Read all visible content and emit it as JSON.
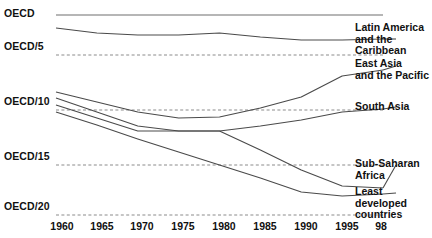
{
  "chart_data": {
    "type": "line",
    "title": "",
    "subtitle": "",
    "xlabel": "",
    "ylabel": "",
    "grid": true,
    "legend_position": "right-inline",
    "x": [
      1960,
      1965,
      1970,
      1975,
      1980,
      1985,
      1990,
      1995,
      1998
    ],
    "xtick_labels": [
      "1960",
      "1965",
      "1970",
      "1975",
      "1980",
      "1985",
      "1990",
      "1995",
      "98"
    ],
    "ytick_labels": [
      "OECD",
      "OECD/5",
      "OECD/10",
      "OECD/15",
      "OECD/20"
    ],
    "ytick_values": [
      1,
      0.2,
      0.1,
      0.06667,
      0.05
    ],
    "yaxis_note": "Income relative to OECD average, descending scale",
    "series": [
      {
        "name": "OECD",
        "label": "OECD",
        "label_side": "left",
        "values": [
          1.0,
          1.0,
          1.0,
          1.0,
          1.0,
          1.0,
          1.0,
          1.0,
          1.0
        ],
        "y_px": [
          15,
          15,
          15,
          15,
          15,
          15,
          15,
          15,
          15
        ]
      },
      {
        "name": "Latin America and the Caribbean",
        "label": "Latin America\nand the Caribbean",
        "label_side": "right",
        "values": [
          0.32,
          0.3,
          0.29,
          0.29,
          0.3,
          0.28,
          0.26,
          0.26,
          0.26
        ],
        "y_px": [
          28,
          33,
          35,
          35,
          33,
          37,
          40,
          40,
          39
        ]
      },
      {
        "name": "East Asia and the Pacific",
        "label": "East Asia\nand the Pacific",
        "label_side": "right",
        "values": [
          0.12,
          0.115,
          0.115,
          0.12,
          0.13,
          0.14,
          0.155,
          0.185,
          0.19
        ],
        "y_px": [
          92,
          102,
          112,
          118,
          117,
          108,
          97,
          76,
          70
        ]
      },
      {
        "name": "South Asia",
        "label": "South Asia",
        "label_side": "right",
        "values": [
          0.112,
          0.106,
          0.1,
          0.098,
          0.098,
          0.1,
          0.104,
          0.11,
          0.113
        ],
        "y_px": [
          98,
          112,
          126,
          131,
          131,
          126,
          120,
          112,
          109
        ]
      },
      {
        "name": "Sub-Saharan Africa",
        "label": "Sub-Saharan\nAfrica",
        "label_side": "right",
        "values": [
          0.105,
          0.102,
          0.099,
          0.097,
          0.097,
          0.086,
          0.072,
          0.062,
          0.06
        ],
        "y_px": [
          105,
          118,
          131,
          131,
          131,
          150,
          170,
          186,
          188
        ]
      },
      {
        "name": "Least developed countries",
        "label": "Least developed\ncountries",
        "label_side": "right",
        "values": [
          0.1,
          0.092,
          0.084,
          0.076,
          0.068,
          0.061,
          0.056,
          0.054,
          0.055
        ],
        "y_px": [
          112,
          125,
          139,
          152,
          165,
          178,
          192,
          196,
          194
        ]
      }
    ],
    "gridlines_y_px": [
      55,
      110,
      165,
      215
    ],
    "xaxis_px": {
      "x0": 56,
      "x1": 383
    },
    "colors": {
      "line": "#4a4a4a",
      "oecd_line": "#6f6f6f",
      "grid": "#8b8b8b",
      "text": "#111111",
      "background": "#ffffff"
    }
  }
}
